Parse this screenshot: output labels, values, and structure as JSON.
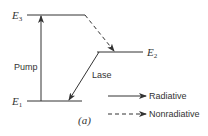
{
  "diagram": {
    "levels": [
      {
        "name": "E",
        "sub": "3"
      },
      {
        "name": "E",
        "sub": "2"
      },
      {
        "name": "E",
        "sub": "1"
      }
    ],
    "transitions": {
      "pump": "Pump",
      "lase": "Lase"
    },
    "legend": [
      {
        "label": "Radiative",
        "style": "solid"
      },
      {
        "label": "Nonradiative",
        "style": "dashed"
      }
    ],
    "caption": "(a)",
    "colors": {
      "line": "#333333",
      "background": "#ffffff"
    }
  }
}
